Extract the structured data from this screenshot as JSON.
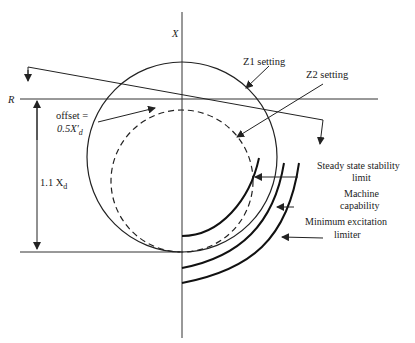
{
  "diagram": {
    "axis_x_label": "X",
    "axis_r_label": "R",
    "labels": {
      "z1": "Z1 setting",
      "z2": "Z2 setting",
      "offset_line1": "offset =",
      "offset_line2": "0.5X'",
      "offset_sub": "d",
      "height_main": "1.1 X",
      "height_sub": "d",
      "sssl_line1": "Steady state stability",
      "sssl_line2": "limit",
      "mc_line1": "Machine",
      "mc_line2": "capability",
      "mel_line1": "Minimum excitation",
      "mel_line2": "limiter"
    },
    "colors": {
      "stroke": "#222222",
      "background": "#ffffff"
    }
  }
}
